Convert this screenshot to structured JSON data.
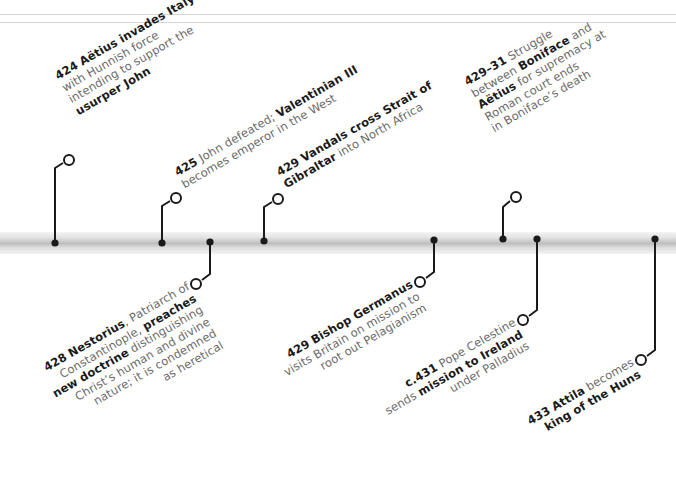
{
  "timeline": {
    "accent_color": "#1a1a1a",
    "text_color": "#6a6a6a",
    "bar_color": "#c4c4c4",
    "events_above": [
      {
        "year": "424",
        "lines": [
          [
            {
              "t": "424",
              "b": true
            },
            {
              "t": " "
            },
            {
              "t": "Aëtius invades Italy",
              "b": true
            }
          ],
          [
            {
              "t": "with Hunnish force"
            }
          ],
          [
            {
              "t": "intending to support the"
            }
          ],
          [
            {
              "t": "usurper John",
              "b": true
            }
          ]
        ]
      },
      {
        "year": "425",
        "lines": [
          [
            {
              "t": "425",
              "b": true
            },
            {
              "t": " John defeated; "
            },
            {
              "t": "Valentinian III",
              "b": true
            }
          ],
          [
            {
              "t": "becomes emperor in the West"
            }
          ]
        ]
      },
      {
        "year": "429",
        "lines": [
          [
            {
              "t": "429",
              "b": true
            },
            {
              "t": " "
            },
            {
              "t": "Vandals cross Strait of",
              "b": true
            }
          ],
          [
            {
              "t": "Gibraltar",
              "b": true
            },
            {
              "t": " into North Africa"
            }
          ]
        ]
      },
      {
        "year": "429–31",
        "lines": [
          [
            {
              "t": "429–31",
              "b": true
            },
            {
              "t": " Struggle"
            }
          ],
          [
            {
              "t": "between "
            },
            {
              "t": "Boniface",
              "b": true
            },
            {
              "t": " and"
            }
          ],
          [
            {
              "t": "Aëtius",
              "b": true
            },
            {
              "t": " for supremacy at"
            }
          ],
          [
            {
              "t": "Roman court ends"
            }
          ],
          [
            {
              "t": "in Boniface’s death"
            }
          ]
        ]
      }
    ],
    "events_below": [
      {
        "year": "428",
        "lines": [
          [
            {
              "t": "428",
              "b": true
            },
            {
              "t": " "
            },
            {
              "t": "Nestorius",
              "b": true
            },
            {
              "t": ", Patriarch of"
            }
          ],
          [
            {
              "t": "Constantinople, "
            },
            {
              "t": "preaches",
              "b": true
            }
          ],
          [
            {
              "t": "new doctrine",
              "b": true
            },
            {
              "t": " distinguishing"
            }
          ],
          [
            {
              "t": "Christ’s human and divine"
            }
          ],
          [
            {
              "t": "nature; it is condemned"
            }
          ],
          [
            {
              "t": "as heretical"
            }
          ]
        ]
      },
      {
        "year": "429",
        "lines": [
          [
            {
              "t": "429",
              "b": true
            },
            {
              "t": " "
            },
            {
              "t": "Bishop Germanus",
              "b": true
            }
          ],
          [
            {
              "t": "visits Britain on mission to"
            }
          ],
          [
            {
              "t": "root out Pelagianism"
            }
          ]
        ]
      },
      {
        "year": "c.431",
        "lines": [
          [
            {
              "t": "c.431",
              "b": true
            },
            {
              "t": " Pope Celestine"
            }
          ],
          [
            {
              "t": "sends "
            },
            {
              "t": "mission to Ireland",
              "b": true
            }
          ],
          [
            {
              "t": "under Palladius"
            }
          ]
        ]
      },
      {
        "year": "433",
        "lines": [
          [
            {
              "t": "433",
              "b": true
            },
            {
              "t": " "
            },
            {
              "t": "Attila",
              "b": true
            },
            {
              "t": " becomes"
            }
          ],
          [
            {
              "t": "king of the Huns",
              "b": true
            }
          ]
        ]
      }
    ]
  }
}
